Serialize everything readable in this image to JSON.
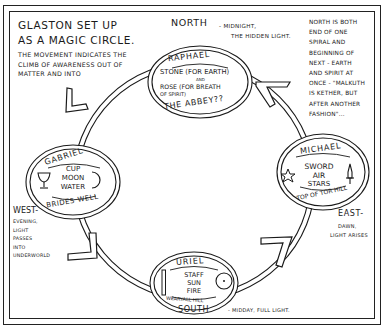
{
  "title": {
    "lines": [
      "Glaston set up",
      "as a magic circle."
    ]
  },
  "subtitle": {
    "lines": [
      "The movement indicates the",
      "climb of awareness out of",
      "matter and into",
      "spirit."
    ]
  },
  "directions": {
    "north": {
      "label": "North",
      "desc_lines": [
        "- midnight,",
        "the hidden light."
      ]
    },
    "south": {
      "label": "South",
      "desc_lines": [
        "- midday, full light."
      ]
    },
    "east": {
      "label": "East-",
      "desc_lines": [
        "dawn,",
        "light arises"
      ]
    },
    "west": {
      "label": "West-",
      "desc_lines": [
        "evening,",
        "light",
        "passes",
        "into",
        "underworld"
      ]
    }
  },
  "north_note": {
    "lines": [
      "North is both",
      "end of one",
      "spiral and",
      "beginning of",
      "next - earth",
      "and spirit at",
      "once - \"Malkuth",
      "is Kether, but",
      "after another",
      "fashion\"..."
    ]
  },
  "stations": {
    "raphael": {
      "name": "Raphael",
      "items": [
        "Stone (for earth)",
        "and",
        "Rose (for breath",
        "of spirit)"
      ],
      "place": "The Abbey??",
      "position": "north"
    },
    "gabriel": {
      "name": "Gabriel",
      "items": [
        "Cup",
        "Moon",
        "Water"
      ],
      "place": "Brides Well",
      "symbols": [
        "cup-icon",
        "crescent-moon-icon"
      ],
      "position": "west"
    },
    "michael": {
      "name": "Michael",
      "items": [
        "Sword",
        "Air",
        "Stars"
      ],
      "place": "Top of Tor Hill",
      "symbols": [
        "star-icon",
        "sword-icon"
      ],
      "position": "east"
    },
    "uriel": {
      "name": "Uriel",
      "items": [
        "Staff",
        "Sun",
        "Fire"
      ],
      "place": "Wearyall Hill",
      "symbols": [
        "staff-icon",
        "sun-icon"
      ],
      "position": "south"
    }
  },
  "flow": {
    "direction": "counter-clockwise",
    "sequence": [
      "Raphael",
      "Gabriel",
      "Uriel",
      "Michael",
      "Raphael"
    ]
  },
  "colors": {
    "ink": "#1a1a1a",
    "paper": "#ffffff"
  }
}
